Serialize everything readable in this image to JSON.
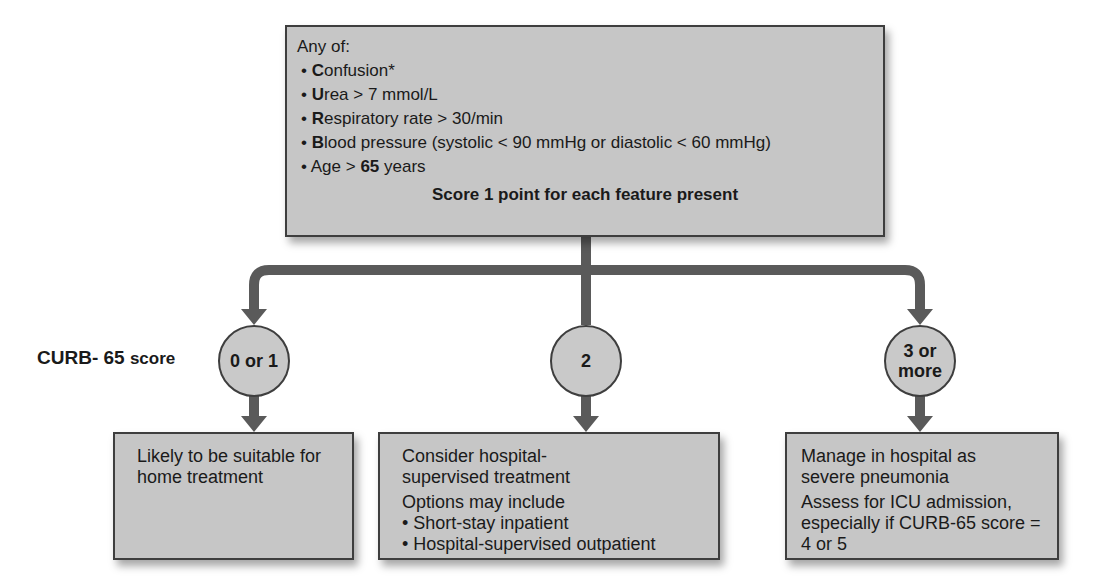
{
  "criteria_box": {
    "intro": "Any of:",
    "items": [
      {
        "bold": "C",
        "rest": "onfusion*"
      },
      {
        "bold": "U",
        "rest": "rea > 7 mmol/L"
      },
      {
        "bold": "R",
        "rest": "espiratory rate > 30/min"
      },
      {
        "bold": "B",
        "rest": "lood pressure (systolic < 90 mmHg or diastolic < 60 mmHg)"
      },
      {
        "pre": "Age > ",
        "bold": "65",
        "rest": " years"
      }
    ],
    "score_note": "Score 1 point for each feature present"
  },
  "score_label": {
    "main": "CURB- 65",
    "suffix": "score"
  },
  "branches": [
    {
      "score": "0 or 1",
      "outcome": {
        "lines": [
          "Likely to be suitable for home treatment"
        ],
        "sub": [],
        "bullets": []
      }
    },
    {
      "score": "2",
      "outcome": {
        "lines": [
          "Consider hospital-supervised treatment"
        ],
        "sub": [
          "Options may include"
        ],
        "bullets": [
          "Short-stay inpatient",
          "Hospital-supervised outpatient"
        ]
      }
    },
    {
      "score": "3 or more",
      "outcome": {
        "lines": [
          "Manage in hospital as severe pneumonia"
        ],
        "sub": [
          "Assess for ICU admission, especially if CURB-65 score = 4 or 5"
        ],
        "bullets": []
      }
    }
  ],
  "colors": {
    "box_fill": "#c6c6c6",
    "connector": "#5a5a5a",
    "border": "#3e3e3e"
  }
}
